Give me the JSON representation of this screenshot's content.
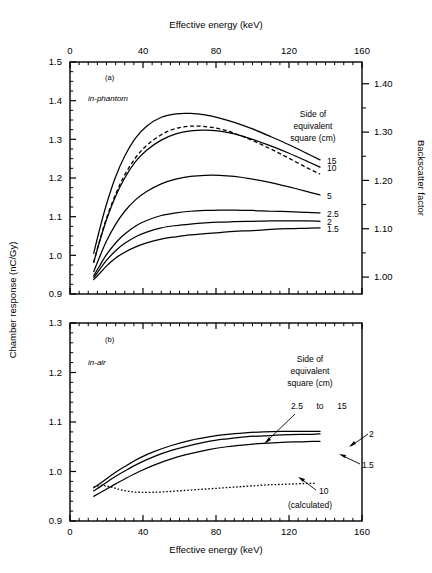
{
  "figure": {
    "title": "",
    "panels": [
      "a",
      "b"
    ]
  },
  "axes": {
    "top_title": "Effective energy (keV)",
    "bottom_title": "Effective energy (keV)",
    "left_title": "Chamber response   (nC/Gy)",
    "right_title": "Backscatter factor",
    "x_ticks": [
      "0",
      "40",
      "80",
      "120",
      "160"
    ],
    "panel_a_y_ticks": [
      "0.9",
      "1.0",
      "1.1",
      "1.2",
      "1.3",
      "1.4",
      "1.5"
    ],
    "panel_a_right_ticks": [
      "1.00",
      "1.10",
      "1.20",
      "1.30",
      "1.40"
    ],
    "panel_b_y_ticks": [
      "0.9",
      "1.0",
      "1.1",
      "1.2",
      "1.3"
    ]
  },
  "panel_a": {
    "tag": "(a)",
    "condition": "in-phantom",
    "legend_title_line1": "Side of",
    "legend_title_line2": "equivalent",
    "legend_title_line3": "square (cm)",
    "curve_labels": [
      "15",
      "10",
      "5",
      "2.5",
      "2",
      "1.5"
    ]
  },
  "panel_b": {
    "tag": "(b)",
    "condition": "in-air",
    "legend_title_line1": "Side of",
    "legend_title_line2": "equivalent",
    "legend_title_line3": "square (cm)",
    "group_label_a": "2.5",
    "group_label_to": "to",
    "group_label_b": "15",
    "curve_label_2": "2",
    "curve_label_15": "1.5",
    "calculated_label": "10",
    "calculated_note": "(calculated)"
  },
  "chart_data": [
    {
      "type": "line",
      "panel": "a",
      "title": "(a) in-phantom",
      "xlabel": "Effective energy (keV)",
      "ylabel": "Chamber response (nC/Gy)",
      "y2label": "Backscatter factor",
      "xlim": [
        0,
        160
      ],
      "ylim": [
        0.9,
        1.5
      ],
      "y2lim": [
        0.965,
        1.445
      ],
      "grid": false,
      "xticks": [
        0,
        40,
        80,
        120,
        160
      ],
      "xminor_step": 5,
      "yticks": [
        0.9,
        1.0,
        1.1,
        1.2,
        1.3,
        1.4,
        1.5
      ],
      "yminor_step": 0.025,
      "y2ticks": [
        1.0,
        1.1,
        1.2,
        1.3,
        1.4
      ],
      "legend_title": "Side of equivalent square (cm)",
      "legend_position": "right-inside",
      "series": [
        {
          "name": "15",
          "style": "solid",
          "x": [
            13,
            16,
            20,
            25,
            30,
            36,
            42,
            50,
            58,
            66,
            74,
            82,
            90,
            100,
            110,
            120,
            130,
            137
          ],
          "y": [
            1.005,
            1.063,
            1.132,
            1.203,
            1.257,
            1.304,
            1.334,
            1.357,
            1.366,
            1.367,
            1.363,
            1.355,
            1.344,
            1.327,
            1.307,
            1.286,
            1.263,
            1.247
          ]
        },
        {
          "name": "10-measured",
          "style": "solid",
          "x": [
            13,
            16,
            20,
            25,
            30,
            36,
            42,
            50,
            58,
            66,
            74,
            82,
            90,
            100,
            110,
            120,
            130,
            137
          ],
          "y": [
            0.982,
            1.032,
            1.092,
            1.153,
            1.2,
            1.243,
            1.272,
            1.298,
            1.314,
            1.322,
            1.324,
            1.321,
            1.314,
            1.3,
            1.283,
            1.264,
            1.243,
            1.228
          ]
        },
        {
          "name": "10-dashed",
          "style": "dashed",
          "x": [
            13,
            16,
            20,
            25,
            30,
            36,
            42,
            50,
            58,
            66,
            74,
            82,
            90,
            100,
            110,
            120,
            130,
            137
          ],
          "y": [
            0.982,
            1.034,
            1.096,
            1.158,
            1.208,
            1.253,
            1.284,
            1.312,
            1.328,
            1.334,
            1.333,
            1.327,
            1.316,
            1.297,
            1.275,
            1.251,
            1.226,
            1.21
          ]
        },
        {
          "name": "5",
          "style": "solid",
          "x": [
            13,
            16,
            20,
            25,
            30,
            36,
            42,
            50,
            58,
            66,
            74,
            82,
            90,
            100,
            110,
            120,
            130,
            137
          ],
          "y": [
            0.958,
            0.993,
            1.037,
            1.08,
            1.114,
            1.144,
            1.165,
            1.185,
            1.197,
            1.204,
            1.207,
            1.207,
            1.204,
            1.197,
            1.188,
            1.177,
            1.165,
            1.156
          ]
        },
        {
          "name": "2.5",
          "style": "solid",
          "x": [
            13,
            16,
            20,
            25,
            30,
            36,
            42,
            50,
            58,
            66,
            74,
            82,
            90,
            100,
            110,
            120,
            130,
            137
          ],
          "y": [
            0.947,
            0.971,
            1.002,
            1.032,
            1.055,
            1.076,
            1.09,
            1.103,
            1.11,
            1.114,
            1.116,
            1.117,
            1.117,
            1.116,
            1.114,
            1.113,
            1.111,
            1.11
          ]
        },
        {
          "name": "2",
          "style": "solid",
          "x": [
            13,
            16,
            20,
            25,
            30,
            36,
            42,
            50,
            58,
            66,
            74,
            82,
            90,
            100,
            110,
            120,
            130,
            137
          ],
          "y": [
            0.942,
            0.962,
            0.987,
            1.012,
            1.031,
            1.048,
            1.06,
            1.071,
            1.077,
            1.081,
            1.084,
            1.086,
            1.087,
            1.088,
            1.089,
            1.089,
            1.089,
            1.088
          ]
        },
        {
          "name": "1.5",
          "style": "solid",
          "x": [
            13,
            16,
            20,
            25,
            30,
            36,
            42,
            50,
            58,
            66,
            74,
            82,
            90,
            100,
            110,
            120,
            130,
            137
          ],
          "y": [
            0.937,
            0.952,
            0.972,
            0.993,
            1.008,
            1.022,
            1.032,
            1.042,
            1.048,
            1.053,
            1.056,
            1.059,
            1.062,
            1.064,
            1.067,
            1.069,
            1.07,
            1.071
          ]
        }
      ]
    },
    {
      "type": "line",
      "panel": "b",
      "title": "(b) in-air",
      "xlabel": "Effective energy (keV)",
      "ylabel": "Chamber response (nC/Gy)",
      "xlim": [
        0,
        160
      ],
      "ylim": [
        0.9,
        1.3
      ],
      "grid": false,
      "xticks": [
        0,
        40,
        80,
        120,
        160
      ],
      "xminor_step": 5,
      "yticks": [
        0.9,
        1.0,
        1.1,
        1.2,
        1.3
      ],
      "yminor_step": 0.02,
      "legend_title": "Side of equivalent square (cm)",
      "legend_position": "right-inside",
      "series": [
        {
          "name": "2.5 to 15",
          "style": "solid",
          "x": [
            13,
            18,
            24,
            30,
            38,
            46,
            56,
            66,
            76,
            86,
            96,
            106,
            116,
            126,
            133,
            137
          ],
          "y": [
            0.967,
            0.98,
            0.996,
            1.01,
            1.027,
            1.04,
            1.053,
            1.063,
            1.07,
            1.075,
            1.078,
            1.08,
            1.081,
            1.081,
            1.081,
            1.081
          ]
        },
        {
          "name": "2",
          "style": "solid",
          "x": [
            13,
            18,
            24,
            30,
            38,
            46,
            56,
            66,
            76,
            86,
            96,
            106,
            116,
            126,
            133,
            137
          ],
          "y": [
            0.961,
            0.973,
            0.988,
            1.001,
            1.017,
            1.03,
            1.043,
            1.053,
            1.061,
            1.066,
            1.07,
            1.072,
            1.074,
            1.075,
            1.075,
            1.076
          ]
        },
        {
          "name": "1.5",
          "style": "solid",
          "x": [
            13,
            18,
            24,
            30,
            38,
            46,
            56,
            66,
            76,
            86,
            96,
            106,
            116,
            126,
            133,
            137
          ],
          "y": [
            0.95,
            0.96,
            0.973,
            0.985,
            1.0,
            1.013,
            1.026,
            1.036,
            1.044,
            1.05,
            1.054,
            1.057,
            1.059,
            1.06,
            1.061,
            1.061
          ]
        },
        {
          "name": "10 (calculated)",
          "style": "dotted",
          "x": [
            13,
            17,
            21,
            25,
            29,
            34,
            39,
            45,
            52,
            60,
            68,
            76,
            84,
            92,
            100,
            108,
            116,
            124,
            130,
            135
          ],
          "y": [
            0.969,
            0.972,
            0.97,
            0.966,
            0.962,
            0.959,
            0.958,
            0.958,
            0.959,
            0.961,
            0.963,
            0.965,
            0.967,
            0.969,
            0.971,
            0.973,
            0.974,
            0.975,
            0.976,
            0.976
          ]
        }
      ]
    }
  ]
}
